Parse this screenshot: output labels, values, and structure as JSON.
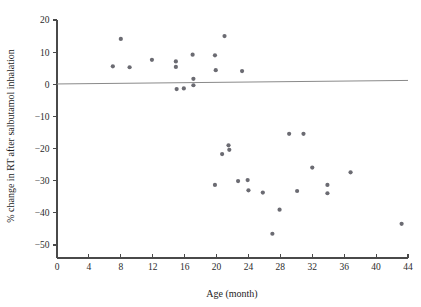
{
  "chart_data": {
    "type": "scatter",
    "title": "",
    "xlabel": "Age (month)",
    "ylabel": "% change in RT after salbutamol inhalation",
    "xlim": [
      0,
      44
    ],
    "ylim": [
      -55,
      20
    ],
    "xticks": [
      0,
      4,
      8,
      12,
      16,
      20,
      24,
      28,
      32,
      36,
      40,
      44
    ],
    "xtick_labels": [
      "0",
      "4",
      "8",
      "12",
      "16",
      "20",
      "24",
      "28",
      "32",
      "36",
      "40",
      "44"
    ],
    "yticks": [
      20,
      10,
      0,
      -10,
      -20,
      -30,
      -40,
      -50
    ],
    "ytick_labels": [
      "20",
      "10",
      "0",
      "−10",
      "−20",
      "−30",
      "−40",
      "−50"
    ],
    "grid": false,
    "legend": null,
    "point_color": "#6b6b72",
    "point_radius": 2.1,
    "series": [
      {
        "name": "subjects",
        "points": [
          [
            7.0,
            5.6
          ],
          [
            8.0,
            14.1
          ],
          [
            9.1,
            5.3
          ],
          [
            11.9,
            7.6
          ],
          [
            14.9,
            7.1
          ],
          [
            14.9,
            5.4
          ],
          [
            15.0,
            -1.5
          ],
          [
            15.9,
            -1.3
          ],
          [
            17.0,
            9.2
          ],
          [
            17.1,
            1.7
          ],
          [
            17.1,
            -0.3
          ],
          [
            19.8,
            9.0
          ],
          [
            19.9,
            4.4
          ],
          [
            21.0,
            15.0
          ],
          [
            23.2,
            4.1
          ],
          [
            19.8,
            -31.3
          ],
          [
            20.7,
            -21.7
          ],
          [
            21.5,
            -19.0
          ],
          [
            21.6,
            -20.4
          ],
          [
            22.7,
            -30.1
          ],
          [
            23.9,
            -29.8
          ],
          [
            24.0,
            -33.0
          ],
          [
            25.8,
            -33.7
          ],
          [
            27.0,
            -46.5
          ],
          [
            27.9,
            -39.0
          ],
          [
            29.1,
            -15.4
          ],
          [
            30.1,
            -33.2
          ],
          [
            30.9,
            -15.4
          ],
          [
            32.0,
            -25.9
          ],
          [
            33.9,
            -31.3
          ],
          [
            33.9,
            -33.9
          ],
          [
            36.8,
            -27.4
          ],
          [
            43.2,
            -43.4
          ]
        ]
      }
    ],
    "trend": {
      "name": "regression-line",
      "x0": 0,
      "y0": 0.1,
      "x1": 44,
      "y1": 1.2,
      "color": "#8a8a8a"
    }
  }
}
